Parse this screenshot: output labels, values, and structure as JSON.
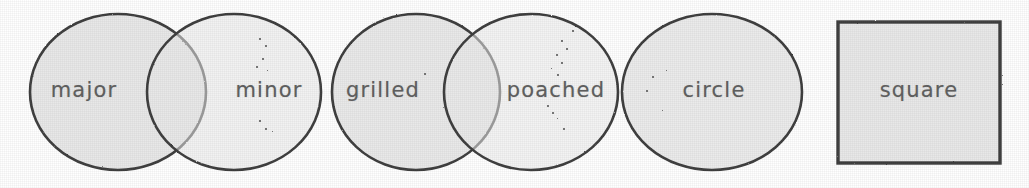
{
  "figure": {
    "background_color": "#ffffff",
    "fill_color": "#e8e8e8",
    "stroke_color": "#3a3a3a",
    "label_color": "#5d5d5d",
    "width": 1029,
    "height": 188
  },
  "shapes": [
    {
      "id": "major",
      "label": "major",
      "type": "circle",
      "cx": 118,
      "cy": 92,
      "rx": 88,
      "ry": 78,
      "label_x": 84,
      "label_y": 90,
      "group": "pair-1"
    },
    {
      "id": "minor",
      "label": "minor",
      "type": "circle",
      "cx": 234,
      "cy": 92,
      "rx": 87,
      "ry": 78,
      "label_x": 269,
      "label_y": 90,
      "group": "pair-1"
    },
    {
      "id": "grilled",
      "label": "grilled",
      "type": "circle",
      "cx": 416,
      "cy": 92,
      "rx": 84,
      "ry": 78,
      "label_x": 383,
      "label_y": 90,
      "group": "pair-2"
    },
    {
      "id": "poached",
      "label": "poached",
      "type": "circle",
      "cx": 531,
      "cy": 92,
      "rx": 87,
      "ry": 78,
      "label_x": 556,
      "label_y": 90,
      "group": "pair-2"
    },
    {
      "id": "circle",
      "label": "circle",
      "type": "circle",
      "cx": 712,
      "cy": 92,
      "rx": 90,
      "ry": 78,
      "label_x": 714,
      "label_y": 90,
      "group": "single"
    },
    {
      "id": "square",
      "label": "square",
      "type": "square",
      "x": 838,
      "y": 22,
      "width": 162,
      "height": 141,
      "label_x": 919,
      "label_y": 90,
      "group": "single"
    }
  ],
  "specks": [
    {
      "x": 259,
      "y": 38,
      "s": 2
    },
    {
      "x": 265,
      "y": 45,
      "s": 2
    },
    {
      "x": 262,
      "y": 58,
      "s": 2
    },
    {
      "x": 256,
      "y": 66,
      "s": 2
    },
    {
      "x": 267,
      "y": 70,
      "s": 1
    },
    {
      "x": 259,
      "y": 120,
      "s": 2
    },
    {
      "x": 265,
      "y": 128,
      "s": 2
    },
    {
      "x": 272,
      "y": 131,
      "s": 1
    },
    {
      "x": 572,
      "y": 30,
      "s": 2
    },
    {
      "x": 561,
      "y": 40,
      "s": 2
    },
    {
      "x": 566,
      "y": 48,
      "s": 2
    },
    {
      "x": 556,
      "y": 54,
      "s": 2
    },
    {
      "x": 561,
      "y": 62,
      "s": 2
    },
    {
      "x": 551,
      "y": 68,
      "s": 1
    },
    {
      "x": 557,
      "y": 74,
      "s": 2
    },
    {
      "x": 547,
      "y": 105,
      "s": 2
    },
    {
      "x": 552,
      "y": 112,
      "s": 2
    },
    {
      "x": 557,
      "y": 118,
      "s": 1
    },
    {
      "x": 563,
      "y": 128,
      "s": 2
    },
    {
      "x": 424,
      "y": 73,
      "s": 2
    },
    {
      "x": 462,
      "y": 25,
      "s": 1
    },
    {
      "x": 652,
      "y": 76,
      "s": 2
    },
    {
      "x": 646,
      "y": 90,
      "s": 2
    },
    {
      "x": 666,
      "y": 70,
      "s": 1
    },
    {
      "x": 662,
      "y": 110,
      "s": 1
    }
  ]
}
